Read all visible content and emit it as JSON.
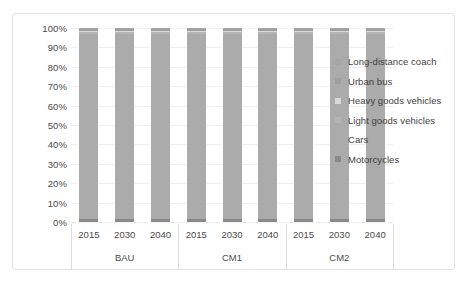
{
  "chart_data": {
    "type": "bar",
    "subtype": "stacked-100-percent",
    "title": "",
    "xlabel": "",
    "ylabel": "",
    "ylim": [
      0,
      100
    ],
    "ytick_labels": [
      "100%",
      "90%",
      "80%",
      "70%",
      "60%",
      "50%",
      "40%",
      "30%",
      "20%",
      "10%",
      "0%"
    ],
    "ytick_values": [
      100,
      90,
      80,
      70,
      60,
      50,
      40,
      30,
      20,
      10,
      0
    ],
    "grid": true,
    "legend_position": "right",
    "categories": [
      "2015",
      "2030",
      "2040",
      "2015",
      "2030",
      "2040",
      "2015",
      "2030",
      "2040"
    ],
    "groups": [
      {
        "label": "BAU",
        "categories": [
          "2015",
          "2030",
          "2040"
        ]
      },
      {
        "label": "CM1",
        "categories": [
          "2015",
          "2030",
          "2040"
        ]
      },
      {
        "label": "CM2",
        "categories": [
          "2015",
          "2030",
          "2040"
        ]
      }
    ],
    "series": [
      {
        "name": "Long-distance coach",
        "color": "#a6a6a6",
        "values": [
          0.6,
          0.6,
          0.6,
          0.6,
          0.6,
          0.6,
          0.6,
          0.6,
          0.6
        ]
      },
      {
        "name": "Urban bus",
        "color": "#9e9e9e",
        "values": [
          0.8,
          0.8,
          0.8,
          0.8,
          0.8,
          0.8,
          0.8,
          0.8,
          0.8
        ]
      },
      {
        "name": "Heavy goods vehicles",
        "color": "#d9d9d9",
        "values": [
          0.7,
          0.7,
          0.7,
          0.7,
          0.7,
          0.7,
          0.7,
          0.7,
          0.7
        ]
      },
      {
        "name": "Light goods vehicles",
        "color": "#b5b5b5",
        "values": [
          1.0,
          1.0,
          1.0,
          1.0,
          1.0,
          1.0,
          1.0,
          1.0,
          1.0
        ]
      },
      {
        "name": "Cars",
        "color": "#ababab",
        "values": [
          95.6,
          95.6,
          95.6,
          95.6,
          95.6,
          95.6,
          95.6,
          95.6,
          95.6
        ]
      },
      {
        "name": "Motorcycles",
        "color": "#8a8a8a",
        "values": [
          1.3,
          1.3,
          1.3,
          1.3,
          1.3,
          1.3,
          1.3,
          1.3,
          1.3
        ]
      }
    ]
  },
  "legend": {
    "items": [
      {
        "label": "Long-distance coach",
        "color": "#a6a6a6"
      },
      {
        "label": "Urban bus",
        "color": "#9e9e9e"
      },
      {
        "label": "Heavy goods vehicles",
        "color": "#d9d9d9"
      },
      {
        "label": "Light goods vehicles",
        "color": "#b5b5b5"
      },
      {
        "label": "Cars",
        "color": "#ababab"
      },
      {
        "label": "Motorcycles",
        "color": "#8a8a8a"
      }
    ]
  },
  "style": {
    "frame_border": "#e3e3e3",
    "gridline": "#f0f0f0",
    "axis_text": "#4a4a4a",
    "legend_text": "#3f3f3f",
    "background": "#ffffff"
  }
}
